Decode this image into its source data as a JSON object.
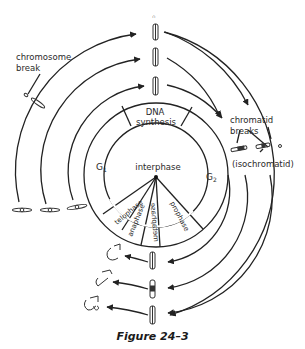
{
  "figure": {
    "caption": "Figure 24–3",
    "center": {
      "x": 156,
      "y": 175
    },
    "colors": {
      "line": "#222222",
      "text": "#2a2a2a",
      "background": "#ffffff"
    }
  },
  "cell_cycle": {
    "inner_label": "interphase",
    "phases": [
      {
        "name": "G1",
        "label": "G",
        "sub": "1"
      },
      {
        "name": "DNA synthesis",
        "line1": "DNA",
        "line2": "synthesis"
      },
      {
        "name": "G2",
        "label": "G",
        "sub": "2"
      }
    ],
    "mitosis_phases": [
      "telophase",
      "anaphase",
      "metaphase",
      "prophase"
    ]
  },
  "annotations": {
    "chromosome_break": {
      "line1": "chromosome",
      "line2": "break"
    },
    "chromatid_breaks": {
      "line1": "chromatid",
      "line2": "breaks"
    },
    "isochromatid": "(isochromatid)"
  },
  "arcs": [
    {
      "radius": 93,
      "from": "G1 (left)",
      "to": "top / metaphase"
    },
    {
      "radius": 115,
      "from": "G1 (left)",
      "to": "top / metaphase"
    },
    {
      "radius": 137,
      "from": "G1 (left)",
      "to": "top / metaphase"
    },
    {
      "radius": 160,
      "from": "G2 (right)",
      "to": "bottom"
    }
  ]
}
